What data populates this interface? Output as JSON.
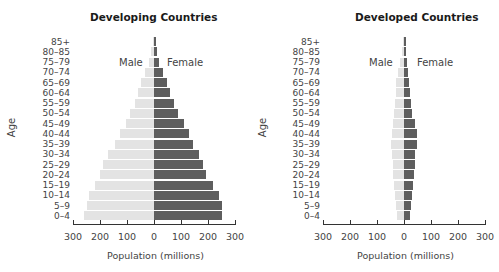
{
  "chart_data": [
    {
      "type": "bar",
      "orientation": "horizontal-pyramid",
      "title": "Developing Countries",
      "xlabel": "Population (millions)",
      "ylabel": "Age",
      "xlim": [
        -300,
        300
      ],
      "xticks": [
        "300",
        "200",
        "100",
        "0",
        "100",
        "200",
        "300"
      ],
      "grid": false,
      "legend": [
        "Male",
        "Female"
      ],
      "categories": [
        "85+",
        "80–85",
        "75–79",
        "70–74",
        "65–69",
        "60–64",
        "55–59",
        "50–54",
        "45–49",
        "40–44",
        "35–39",
        "30–34",
        "25–29",
        "20–24",
        "15–19",
        "10–14",
        "5–9",
        "0–4"
      ],
      "series": [
        {
          "name": "Male",
          "color": "#e3e3e3",
          "values": [
            5,
            12,
            20,
            35,
            48,
            60,
            72,
            90,
            105,
            125,
            145,
            170,
            189,
            200,
            219,
            241,
            248,
            259
          ]
        },
        {
          "name": "Female",
          "color": "#5e5e5e",
          "values": [
            6,
            12,
            18,
            32,
            47,
            60,
            73,
            90,
            110,
            128,
            145,
            167,
            182,
            193,
            218,
            241,
            252,
            252
          ]
        }
      ]
    },
    {
      "type": "bar",
      "orientation": "horizontal-pyramid",
      "title": "Developed Countries",
      "xlabel": "Population (millions)",
      "ylabel": "Age",
      "xlim": [
        -300,
        300
      ],
      "xticks": [
        "300",
        "200",
        "100",
        "0",
        "100",
        "200",
        "300"
      ],
      "grid": false,
      "legend": [
        "Male",
        "Female"
      ],
      "categories": [
        "85+",
        "80–85",
        "75–79",
        "70–74",
        "65–69",
        "60–64",
        "55–59",
        "50–54",
        "45–49",
        "40–44",
        "35–39",
        "30–34",
        "25–29",
        "20–24",
        "15–19",
        "10–14",
        "5–9",
        "0–4"
      ],
      "series": [
        {
          "name": "Male",
          "color": "#e3e3e3",
          "values": [
            4,
            8,
            14,
            22,
            28,
            31,
            33,
            36,
            40,
            45,
            48,
            44,
            42,
            40,
            36,
            33,
            30,
            27
          ]
        },
        {
          "name": "Female",
          "color": "#5e5e5e",
          "values": [
            6,
            9,
            12,
            16,
            20,
            22,
            25,
            30,
            40,
            47,
            47,
            42,
            40,
            37,
            32,
            30,
            25,
            22
          ]
        }
      ]
    }
  ],
  "left": {
    "title": "Developing Countries",
    "ylabel": "Age",
    "male_label": "Male",
    "female_label": "Female",
    "xlabel": "Population (millions)"
  },
  "right": {
    "title": "Developed Countries",
    "ylabel": "Age",
    "male_label": "Male",
    "female_label": "Female",
    "xlabel": "Population (millions)"
  }
}
